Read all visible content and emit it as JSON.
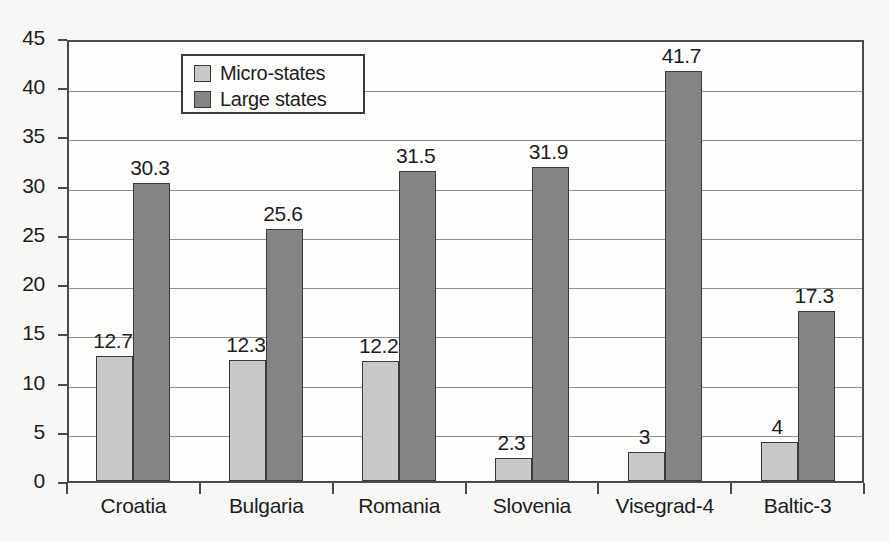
{
  "chart_data": {
    "type": "bar",
    "title": "",
    "subtitle": "",
    "xlabel": "",
    "ylabel": "",
    "ylim": [
      0,
      45
    ],
    "ytick_step": 5,
    "yticks": [
      "45",
      "40",
      "35",
      "30",
      "25",
      "20",
      "15",
      "10",
      "5",
      "0"
    ],
    "grid": true,
    "legend_position": "top-left-inside",
    "categories": [
      "Croatia",
      "Bulgaria",
      "Romania",
      "Slovenia",
      "Visegrad-4",
      "Baltic-3"
    ],
    "series": [
      {
        "name": "Micro-states",
        "color": "#c9c9c9",
        "values": [
          12.7,
          12.3,
          12.2,
          2.3,
          3,
          4
        ],
        "labels": [
          "12.7",
          "12.3",
          "12.2",
          "2.3",
          "3",
          "4"
        ]
      },
      {
        "name": "Large states",
        "color": "#858585",
        "values": [
          30.3,
          25.6,
          31.5,
          31.9,
          41.7,
          17.3
        ],
        "labels": [
          "30.3",
          "25.6",
          "31.5",
          "31.9",
          "41.7",
          "17.3"
        ]
      }
    ]
  },
  "legend": {
    "entries": [
      {
        "label": "Micro-states",
        "swatch": "micro"
      },
      {
        "label": "Large states",
        "swatch": "large"
      }
    ]
  },
  "colors": {
    "micro_states": "#c9c9c9",
    "large_states": "#858585",
    "axis": "#4a4a4a",
    "gridline": "#8f8f8f",
    "text": "#1d1d1d",
    "background": "#f7f7f5",
    "plot_background": "#fdfdfc"
  }
}
